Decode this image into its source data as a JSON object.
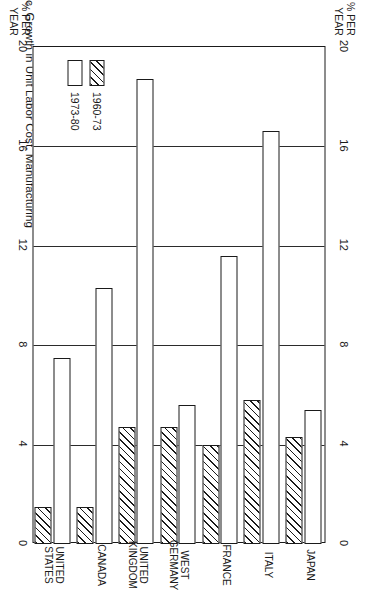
{
  "figure": {
    "title": "c. Growth in Unit Labor Cost, Manufacturing",
    "axis_title_line1": "% PER",
    "axis_title_line2": "YEAR"
  },
  "legend": {
    "items": [
      {
        "label": "1960-73",
        "pattern": "hatched"
      },
      {
        "label": "1973-80",
        "pattern": "open"
      }
    ]
  },
  "chart_data": {
    "type": "bar",
    "orientation": "horizontal",
    "title": "c. Growth in Unit Labor Cost, Manufacturing",
    "xlabel": "% PER YEAR",
    "ylabel": "",
    "xlim": [
      0,
      20
    ],
    "xticks": [
      0,
      4,
      8,
      12,
      16,
      20
    ],
    "xtick_labels": [
      "0",
      "4",
      "8",
      "12",
      "16",
      "20"
    ],
    "grid": true,
    "legend_position": "inside-left",
    "categories": [
      "UNITED\nSTATES",
      "CANADA",
      "UNITED\nKINGDOM",
      "WEST\nGERMANY",
      "FRANCE",
      "ITALY",
      "JAPAN"
    ],
    "category_labels_flat": [
      "UNITED STATES",
      "CANADA",
      "UNITED KINGDOM",
      "WEST GERMANY",
      "FRANCE",
      "ITALY",
      "JAPAN"
    ],
    "series": [
      {
        "name": "1960-73",
        "pattern": "hatched",
        "values": [
          1.5,
          1.5,
          4.7,
          4.7,
          4.0,
          5.8,
          4.3
        ]
      },
      {
        "name": "1973-80",
        "pattern": "open",
        "values": [
          7.5,
          10.3,
          18.7,
          5.6,
          11.6,
          16.6,
          5.4
        ]
      }
    ]
  }
}
